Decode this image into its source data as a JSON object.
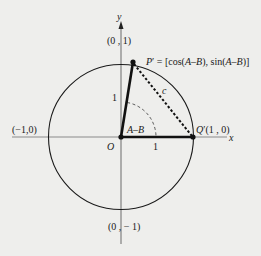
{
  "diagram": {
    "axes": {
      "x_label": "x",
      "y_label": "y"
    },
    "points": {
      "top": "(0 , 1)",
      "bottom": "(0 , − 1)",
      "left": "(−1,0)",
      "origin": "O",
      "p_prime": "P′ = [cos(A–B), sin(A–B)]",
      "q_prime": "Q′(1 , 0)"
    },
    "segment_labels": {
      "op_length": "1",
      "oq_length": "1",
      "chord": "c",
      "angle": "A–B"
    },
    "colors": {
      "background": "#eeeeec",
      "axis": "#8a8a8a",
      "stroke": "#111111"
    }
  }
}
